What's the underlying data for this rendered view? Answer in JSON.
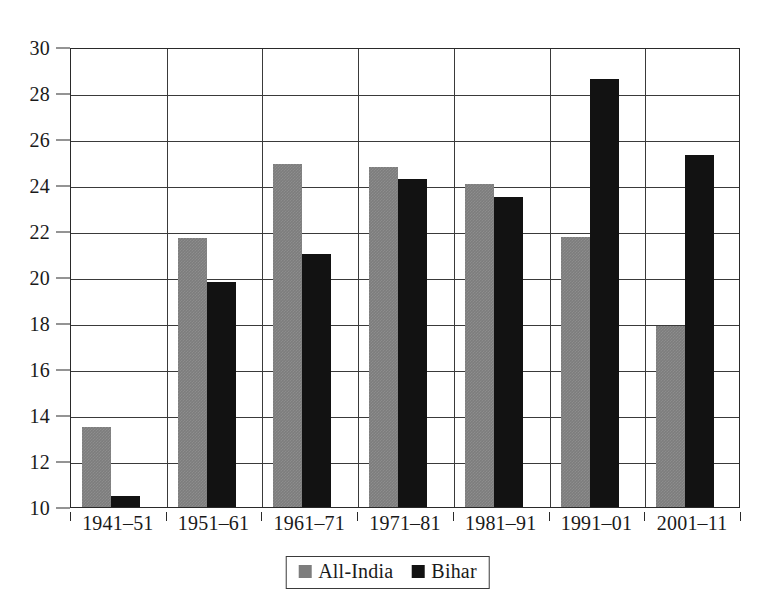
{
  "chart_data": {
    "type": "bar",
    "title": "",
    "subtitle": "",
    "xlabel": "",
    "ylabel": "",
    "categories": [
      "1941–51",
      "1951–61",
      "1961–71",
      "1971–81",
      "1981–91",
      "1991–01",
      "2001–11"
    ],
    "series": [
      {
        "name": "All-India",
        "color": "#7d7d7d",
        "values": [
          13.5,
          21.7,
          24.9,
          24.8,
          24.05,
          21.75,
          17.85
        ]
      },
      {
        "name": "Bihar",
        "color": "#121212",
        "values": [
          10.5,
          19.8,
          21.0,
          24.25,
          23.5,
          28.6,
          25.3
        ]
      }
    ],
    "ylim": [
      10,
      30
    ],
    "yticks": [
      10,
      12,
      14,
      16,
      18,
      20,
      22,
      24,
      26,
      28,
      30
    ],
    "ytick_labels": [
      "10",
      "12",
      "14",
      "16",
      "18",
      "20",
      "22",
      "24",
      "26",
      "28",
      "30"
    ],
    "grid": true,
    "grid_axis": "both",
    "legend_position": "bottom",
    "bar_style": "grouped"
  },
  "legend": {
    "entries": [
      {
        "label": "All-India",
        "swatch": "gray-swatch"
      },
      {
        "label": "Bihar",
        "swatch": "black-swatch"
      }
    ]
  }
}
